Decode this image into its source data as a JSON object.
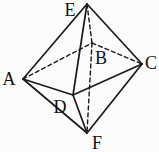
{
  "figure": {
    "type": "geometry-line-drawing",
    "shape": "octahedron",
    "background": "#fcfcfc",
    "stroke_color": "#1a1a1a",
    "label_color": "#111111",
    "vertices": {
      "E": {
        "label": "E",
        "x": 87,
        "y": 4,
        "label_x": 70,
        "label_y": 16
      },
      "A": {
        "label": "A",
        "x": 23,
        "y": 79,
        "label_x": 9,
        "label_y": 85
      },
      "B": {
        "label": "B",
        "x": 92,
        "y": 43,
        "label_x": 101,
        "label_y": 64
      },
      "C": {
        "label": "C",
        "x": 142,
        "y": 64,
        "label_x": 151,
        "label_y": 69
      },
      "D": {
        "label": "D",
        "x": 73,
        "y": 95,
        "label_x": 60,
        "label_y": 113
      },
      "F": {
        "label": "F",
        "x": 87,
        "y": 133,
        "label_x": 97,
        "label_y": 149
      }
    },
    "edges": [
      {
        "from": "A",
        "to": "E",
        "style": "solid"
      },
      {
        "from": "E",
        "to": "C",
        "style": "solid"
      },
      {
        "from": "A",
        "to": "D",
        "style": "solid"
      },
      {
        "from": "D",
        "to": "C",
        "style": "solid"
      },
      {
        "from": "A",
        "to": "F",
        "style": "solid"
      },
      {
        "from": "C",
        "to": "F",
        "style": "solid"
      },
      {
        "from": "E",
        "to": "D",
        "style": "solid"
      },
      {
        "from": "D",
        "to": "F",
        "style": "solid"
      },
      {
        "from": "A",
        "to": "B",
        "style": "dashed"
      },
      {
        "from": "B",
        "to": "C",
        "style": "dashed"
      },
      {
        "from": "E",
        "to": "B",
        "style": "dashed"
      },
      {
        "from": "B",
        "to": "F",
        "style": "dashed"
      }
    ]
  }
}
